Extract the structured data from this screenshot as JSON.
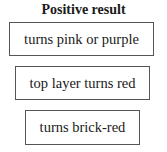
{
  "title": "Positive result",
  "results": [
    {
      "label": "turns pink or purple"
    },
    {
      "label": "top layer turns red"
    },
    {
      "label": "turns brick-red"
    }
  ]
}
